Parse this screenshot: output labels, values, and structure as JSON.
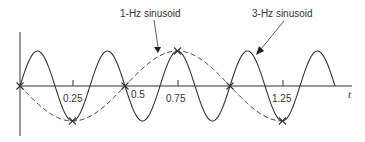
{
  "diagram": {
    "labels": {
      "one_hz": "1-Hz sinusoid",
      "three_hz": "3-Hz sinusoid",
      "t_axis": "t"
    },
    "ticks": [
      "0.25",
      "0.5",
      "0.75",
      "1.25"
    ],
    "colors": {
      "line": "#333333",
      "background": "#ffffff"
    }
  },
  "chart_data": {
    "type": "line",
    "title": "",
    "xlabel": "t",
    "ylabel": "",
    "x_ticks": [
      0.25,
      0.5,
      0.75,
      1.25
    ],
    "xlim": [
      0,
      1.5
    ],
    "series": [
      {
        "name": "1-Hz sinusoid",
        "style": "dashed",
        "formula": "-sin(2*pi*1*t)",
        "range": [
          0,
          1.25
        ]
      },
      {
        "name": "3-Hz sinusoid",
        "style": "solid",
        "formula": "sin(2*pi*3*t)",
        "range": [
          0,
          1.5
        ]
      }
    ],
    "sample_points_marked_x": [
      0,
      0.25,
      0.5,
      0.75,
      1.0,
      1.25
    ],
    "grid": false
  }
}
